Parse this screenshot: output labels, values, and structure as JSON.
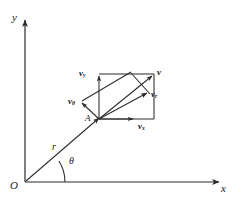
{
  "figure": {
    "type": "vector-decomposition-diagram",
    "background": "#ffffff",
    "stroke_color": "#2b2b2b",
    "text_color": "#1a1a1a",
    "axes": {
      "x_label": "x",
      "y_label": "y",
      "origin_label": "O"
    },
    "points": {
      "origin": "O",
      "particle": "A"
    },
    "position_vector": {
      "label": "r",
      "angle_label": "θ",
      "from": "O",
      "to": "A"
    },
    "vectors": [
      {
        "name": "v",
        "base": "v",
        "sub": "",
        "label": "v"
      },
      {
        "name": "v-x",
        "base": "v",
        "sub": "x",
        "label": "vx"
      },
      {
        "name": "v-y",
        "base": "v",
        "sub": "y",
        "label": "vy"
      },
      {
        "name": "v-r",
        "base": "v",
        "sub": "r",
        "label": "vr"
      },
      {
        "name": "v-theta",
        "base": "v",
        "sub": "θ",
        "label": "vθ"
      }
    ]
  }
}
